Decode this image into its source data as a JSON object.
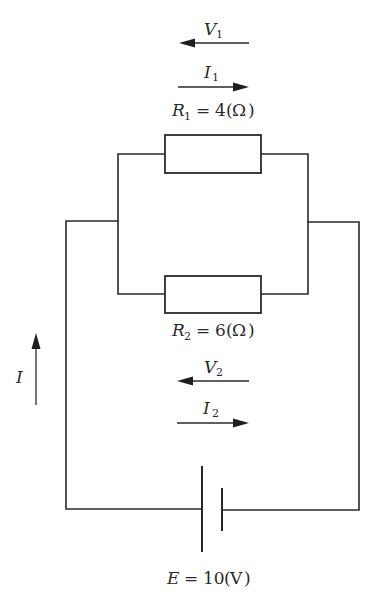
{
  "diagram": {
    "type": "electric-circuit",
    "components": {
      "r1": {
        "symbol": "R",
        "subscript": "1",
        "value": "4",
        "unit": "Ω",
        "label": "R1 = 4(Ω)"
      },
      "r2": {
        "symbol": "R",
        "subscript": "2",
        "value": "6",
        "unit": "Ω",
        "label": "R2 = 6(Ω)"
      },
      "battery": {
        "symbol": "E",
        "value": "10",
        "unit": "V",
        "label": "E = 10(V)"
      }
    },
    "arrows": {
      "v1": {
        "symbol": "V",
        "subscript": "1",
        "direction": "left"
      },
      "i1": {
        "symbol": "I",
        "subscript": "1",
        "direction": "right"
      },
      "v2": {
        "symbol": "V",
        "subscript": "2",
        "direction": "left"
      },
      "i2": {
        "symbol": "I",
        "subscript": "2",
        "direction": "right"
      },
      "i": {
        "symbol": "I",
        "subscript": "",
        "direction": "up"
      }
    },
    "text": {
      "equals": "=",
      "open_paren": "(",
      "close_paren": ")"
    },
    "colors": {
      "line": "#2a2a2a",
      "background": "#ffffff"
    }
  }
}
